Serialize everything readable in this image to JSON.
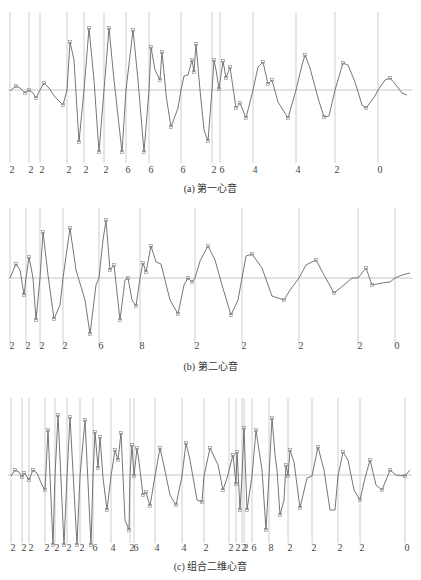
{
  "chart_data": [
    {
      "type": "line",
      "title": "(a) 第一心音",
      "caption": "(a) 第一心音",
      "panel": {
        "top": 12,
        "bottom": 163,
        "axis_y": 90,
        "label_y": 168,
        "caption_y": 186
      },
      "segment_lines_x": [
        10,
        29,
        40,
        67,
        84,
        104,
        126,
        149,
        181,
        212,
        220,
        253,
        296,
        335,
        378
      ],
      "segment_labels": [
        "2",
        "2",
        "2",
        "2",
        "2",
        "2",
        "6",
        "6",
        "6",
        "2",
        "6",
        "4",
        "4",
        "2",
        "0"
      ],
      "waveform": [
        [
          10,
          91
        ],
        [
          16,
          86
        ],
        [
          20,
          88
        ],
        [
          25,
          93
        ],
        [
          29,
          90
        ],
        [
          33,
          93
        ],
        [
          36,
          98
        ],
        [
          40,
          90
        ],
        [
          44,
          83
        ],
        [
          49,
          88
        ],
        [
          55,
          97
        ],
        [
          63,
          105
        ],
        [
          67,
          90
        ],
        [
          70,
          42
        ],
        [
          74,
          60
        ],
        [
          79,
          142
        ],
        [
          84,
          90
        ],
        [
          89,
          28
        ],
        [
          94,
          80
        ],
        [
          99,
          152
        ],
        [
          104,
          90
        ],
        [
          109,
          28
        ],
        [
          114,
          80
        ],
        [
          122,
          152
        ],
        [
          126,
          90
        ],
        [
          133,
          30
        ],
        [
          138,
          80
        ],
        [
          144,
          152
        ],
        [
          149,
          90
        ],
        [
          151,
          47
        ],
        [
          155,
          70
        ],
        [
          160,
          80
        ],
        [
          162,
          52
        ],
        [
          165,
          83
        ],
        [
          166,
          95
        ],
        [
          171,
          127
        ],
        [
          178,
          108
        ],
        [
          181,
          90
        ],
        [
          184,
          76
        ],
        [
          188,
          75
        ],
        [
          192,
          60
        ],
        [
          194,
          72
        ],
        [
          196,
          44
        ],
        [
          200,
          90
        ],
        [
          204,
          130
        ],
        [
          208,
          141
        ],
        [
          212,
          90
        ],
        [
          214,
          60
        ],
        [
          216,
          70
        ],
        [
          219,
          89
        ],
        [
          223,
          61
        ],
        [
          226,
          78
        ],
        [
          230,
          67
        ],
        [
          236,
          108
        ],
        [
          240,
          103
        ],
        [
          246,
          118
        ],
        [
          253,
          90
        ],
        [
          258,
          67
        ],
        [
          263,
          62
        ],
        [
          268,
          84
        ],
        [
          272,
          80
        ],
        [
          278,
          102
        ],
        [
          288,
          118
        ],
        [
          296,
          90
        ],
        [
          302,
          65
        ],
        [
          305,
          55
        ],
        [
          310,
          68
        ],
        [
          318,
          98
        ],
        [
          324,
          117
        ],
        [
          329,
          116
        ],
        [
          335,
          90
        ],
        [
          343,
          63
        ],
        [
          348,
          65
        ],
        [
          355,
          82
        ],
        [
          362,
          105
        ],
        [
          366,
          108
        ],
        [
          375,
          96
        ],
        [
          378,
          90
        ],
        [
          385,
          80
        ],
        [
          390,
          78
        ],
        [
          396,
          85
        ],
        [
          402,
          93
        ],
        [
          407,
          95
        ]
      ]
    },
    {
      "type": "line",
      "title": "(b) 第二心音",
      "caption": "(b) 第二心音",
      "panel": {
        "top": 208,
        "bottom": 346,
        "axis_y": 278,
        "label_y": 344,
        "caption_y": 364
      },
      "segment_lines_x": [
        10,
        26,
        40,
        63,
        99,
        140,
        195,
        242,
        299,
        358,
        395
      ],
      "segment_labels": [
        "2",
        "2",
        "2",
        "2",
        "6",
        "8",
        "2",
        "2",
        "2",
        "2",
        "0"
      ],
      "waveform": [
        [
          10,
          278
        ],
        [
          16,
          264
        ],
        [
          20,
          270
        ],
        [
          24,
          295
        ],
        [
          26,
          278
        ],
        [
          29,
          257
        ],
        [
          33,
          278
        ],
        [
          36,
          320
        ],
        [
          40,
          278
        ],
        [
          43,
          232
        ],
        [
          48,
          275
        ],
        [
          54,
          319
        ],
        [
          60,
          305
        ],
        [
          63,
          278
        ],
        [
          70,
          228
        ],
        [
          76,
          270
        ],
        [
          85,
          300
        ],
        [
          90,
          334
        ],
        [
          96,
          285
        ],
        [
          99,
          278
        ],
        [
          103,
          240
        ],
        [
          106,
          220
        ],
        [
          110,
          270
        ],
        [
          114,
          265
        ],
        [
          120,
          320
        ],
        [
          125,
          280
        ],
        [
          128,
          278
        ],
        [
          132,
          300
        ],
        [
          136,
          306
        ],
        [
          140,
          278
        ],
        [
          143,
          263
        ],
        [
          146,
          272
        ],
        [
          151,
          246
        ],
        [
          156,
          262
        ],
        [
          161,
          264
        ],
        [
          170,
          300
        ],
        [
          178,
          314
        ],
        [
          184,
          285
        ],
        [
          188,
          278
        ],
        [
          192,
          282
        ],
        [
          195,
          278
        ],
        [
          200,
          261
        ],
        [
          208,
          246
        ],
        [
          215,
          260
        ],
        [
          222,
          285
        ],
        [
          231,
          315
        ],
        [
          238,
          300
        ],
        [
          242,
          278
        ],
        [
          246,
          256
        ],
        [
          252,
          254
        ],
        [
          262,
          268
        ],
        [
          272,
          296
        ],
        [
          284,
          300
        ],
        [
          290,
          290
        ],
        [
          299,
          278
        ],
        [
          306,
          265
        ],
        [
          316,
          260
        ],
        [
          324,
          275
        ],
        [
          334,
          293
        ],
        [
          344,
          285
        ],
        [
          352,
          278
        ],
        [
          358,
          278
        ],
        [
          366,
          268
        ],
        [
          372,
          285
        ],
        [
          382,
          283
        ],
        [
          390,
          282
        ],
        [
          395,
          278
        ],
        [
          402,
          275
        ],
        [
          410,
          273
        ]
      ]
    },
    {
      "type": "line",
      "title": "(c) 组合二维心音",
      "caption": "(c) 组合二维心音",
      "panel": {
        "top": 398,
        "bottom": 543,
        "axis_y": 475,
        "label_y": 546,
        "caption_y": 564
      },
      "segment_lines_x": [
        11,
        22,
        29,
        45,
        55,
        67,
        80,
        93,
        111,
        130,
        134,
        155,
        182,
        204,
        229,
        236,
        242,
        244,
        252,
        269,
        288,
        312,
        338,
        360,
        405
      ],
      "segment_labels": [
        "2",
        "2",
        "2",
        "2",
        "2",
        "2",
        "2",
        "6",
        "4",
        "2",
        "6",
        "4",
        "4",
        "2",
        "2",
        "2",
        "2",
        "2",
        "6",
        "8",
        "2",
        "2",
        "2",
        "2",
        "0"
      ],
      "waveform": [
        [
          11,
          476
        ],
        [
          15,
          470
        ],
        [
          19,
          472
        ],
        [
          22,
          477
        ],
        [
          24,
          473
        ],
        [
          26,
          475
        ],
        [
          29,
          480
        ],
        [
          33,
          470
        ],
        [
          37,
          473
        ],
        [
          42,
          485
        ],
        [
          45,
          490
        ],
        [
          48,
          430
        ],
        [
          53,
          545
        ],
        [
          55,
          476
        ],
        [
          58,
          415
        ],
        [
          64,
          545
        ],
        [
          67,
          476
        ],
        [
          70,
          417
        ],
        [
          77,
          545
        ],
        [
          80,
          476
        ],
        [
          85,
          420
        ],
        [
          91,
          545
        ],
        [
          93,
          476
        ],
        [
          95,
          432
        ],
        [
          98,
          468
        ],
        [
          100,
          437
        ],
        [
          103,
          478
        ],
        [
          107,
          510
        ],
        [
          111,
          476
        ],
        [
          115,
          450
        ],
        [
          118,
          460
        ],
        [
          121,
          433
        ],
        [
          125,
          520
        ],
        [
          129,
          530
        ],
        [
          130,
          476
        ],
        [
          132,
          445
        ],
        [
          134,
          476
        ],
        [
          137,
          448
        ],
        [
          139,
          462
        ],
        [
          143,
          495
        ],
        [
          146,
          492
        ],
        [
          150,
          506
        ],
        [
          155,
          476
        ],
        [
          160,
          448
        ],
        [
          164,
          466
        ],
        [
          170,
          495
        ],
        [
          176,
          505
        ],
        [
          182,
          476
        ],
        [
          186,
          443
        ],
        [
          190,
          460
        ],
        [
          197,
          500
        ],
        [
          202,
          502
        ],
        [
          204,
          476
        ],
        [
          210,
          448
        ],
        [
          218,
          465
        ],
        [
          223,
          490
        ],
        [
          228,
          475
        ],
        [
          229,
          470
        ],
        [
          233,
          455
        ],
        [
          236,
          484
        ],
        [
          237,
          452
        ],
        [
          240,
          510
        ],
        [
          242,
          476
        ],
        [
          244,
          428
        ],
        [
          247,
          510
        ],
        [
          252,
          476
        ],
        [
          256,
          430
        ],
        [
          262,
          470
        ],
        [
          266,
          530
        ],
        [
          269,
          476
        ],
        [
          272,
          418
        ],
        [
          275,
          455
        ],
        [
          277,
          470
        ],
        [
          280,
          515
        ],
        [
          284,
          500
        ],
        [
          286,
          465
        ],
        [
          288,
          476
        ],
        [
          290,
          450
        ],
        [
          294,
          462
        ],
        [
          300,
          508
        ],
        [
          307,
          478
        ],
        [
          312,
          476
        ],
        [
          318,
          447
        ],
        [
          324,
          470
        ],
        [
          330,
          510
        ],
        [
          335,
          510
        ],
        [
          338,
          476
        ],
        [
          343,
          452
        ],
        [
          348,
          460
        ],
        [
          354,
          490
        ],
        [
          360,
          500
        ],
        [
          365,
          478
        ],
        [
          370,
          460
        ],
        [
          376,
          485
        ],
        [
          382,
          490
        ],
        [
          390,
          470
        ],
        [
          396,
          475
        ],
        [
          405,
          476
        ],
        [
          410,
          470
        ]
      ]
    }
  ],
  "style": {
    "line_color": "#c8c8c8",
    "axis_color": "#b8b8b8",
    "wave_color": "#666666",
    "marker_color": "#888888"
  }
}
